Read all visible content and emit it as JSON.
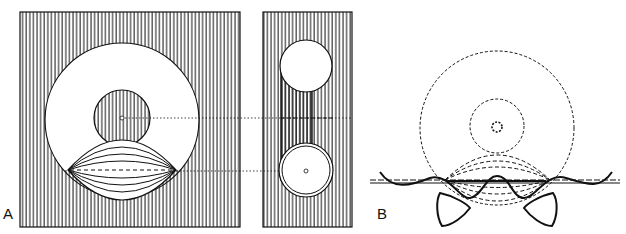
{
  "figure": {
    "panels": [
      {
        "label": "A",
        "description": "Hatched plate with large open circle, inner hatched disc, lens-shaped bundle of curves; side view with two circular openings"
      },
      {
        "label": "B",
        "description": "Dashed outline of circles and lens bundle with wavy membrane and two triangular bodies"
      }
    ],
    "colors": {
      "ink": "#111111",
      "background": "#ffffff"
    }
  }
}
